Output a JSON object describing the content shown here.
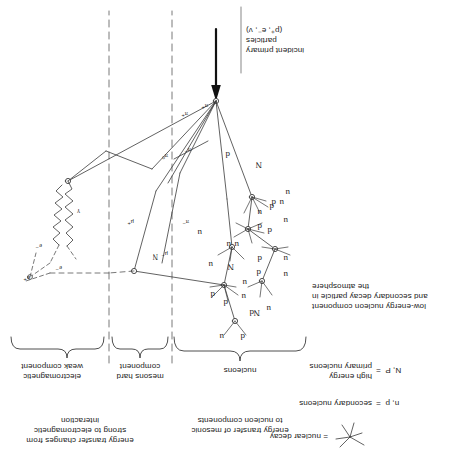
{
  "figure": {
    "title_note": "cosmic ray extensive air shower cascade diagram (printed rotated 180 degrees)",
    "bottom_caption": {
      "line1": "incident primary",
      "line2": "particles",
      "line3": "(p⁺, e⁻, ν)"
    },
    "component_brackets": [
      {
        "id": "nucleons",
        "label": "nucleons"
      },
      {
        "id": "mesons-hard",
        "label_line1": "mesons hard",
        "label_line2": "component"
      },
      {
        "id": "electromagnetic-weak",
        "label_line1": "electromagnetic",
        "label_line2": "weak component"
      }
    ],
    "annotations": {
      "nucleonic_transfer": {
        "line1": "energy transfer of mesonic",
        "line2": "to nucleon components"
      },
      "em_transfer": {
        "line1": "energy transfer changes from",
        "line2": "strong to electromagnetic",
        "line3": "interaction"
      },
      "low_energy_nucleon": {
        "line1": "low-energy nucleon component",
        "line2": "and secondary decay particle in",
        "line3": "the atmosphere"
      }
    },
    "legend": [
      {
        "id": "primary-nucleons",
        "symbol": "N, P  =",
        "line1": "high energy",
        "line2": "primary nucleons"
      },
      {
        "id": "secondary-nucleons",
        "symbol": "n, p  =",
        "line1": "secondary nucleons",
        "line2": ""
      },
      {
        "id": "nuclear-decay",
        "symbol": "",
        "line1": "= nuclear decay",
        "line2": "",
        "icon": "star-burst-icon"
      }
    ],
    "particle_labels": {
      "nucleon": "N",
      "nucleon_secondary_up": "u",
      "nucleon_secondary_down": "d",
      "pion_plus": "π⁺",
      "pion_minus": "π⁻",
      "pion_zero": "π⁰",
      "muon_plus": "μ⁺",
      "muon_minus": "μ⁻",
      "electron_minus": "e⁻",
      "electron_plus": "e⁺",
      "photon": "γ"
    },
    "nucleon_cascade": {
      "vertex_quark_labels": [
        {
          "u": "u",
          "d": "d"
        },
        {
          "u": "u",
          "d": "d"
        },
        {
          "u": "u",
          "d": "d"
        },
        {
          "u": "u",
          "d": "d"
        },
        {
          "u": "u",
          "d": "d"
        },
        {
          "u": "u",
          "d": "d"
        },
        {
          "u": "u",
          "d": "d"
        }
      ],
      "nucleon_line_labels": [
        "N",
        "N",
        "N",
        "N"
      ]
    },
    "colors": {
      "ink": "#1a1a1a",
      "line": "#3a3a3a",
      "dashed": "#555555",
      "background": "#ffffff"
    }
  }
}
